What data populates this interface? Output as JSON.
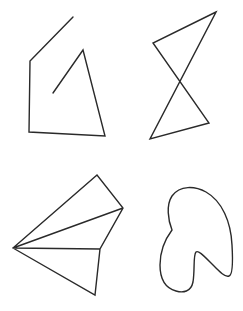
{
  "figure": {
    "width": 243,
    "height": 311,
    "background": "#ffffff",
    "stroke_color": "#2a2a2a",
    "shapes": [
      {
        "name": "open-spiral-polyline",
        "type": "polyline",
        "points": "73,17 30,61 29,132 105,136 83,50 53,93"
      },
      {
        "name": "bowtie-crossed-quadrilateral",
        "type": "polygon",
        "points": "216,12 153,43 209,123 150,139"
      },
      {
        "name": "fan-triangulated-polygon",
        "type": "path",
        "d": "M13,248 L97,175 L123,208 L100,249 L95,295 Z M13,248 L123,208 M13,248 L100,249"
      },
      {
        "name": "kidney-blob-curve",
        "type": "path",
        "d": "M172,230 C168,220 166,205 172,196 C180,185 195,186 206,192 C222,201 231,222 232,245 C233,262 233,275 229,276 C225,278 218,270 210,262 C203,255 198,250 196,252 C193,255 195,270 193,282 C191,292 183,293 176,291 C165,288 160,278 160,265 C160,248 166,238 172,230 Z"
      }
    ]
  }
}
